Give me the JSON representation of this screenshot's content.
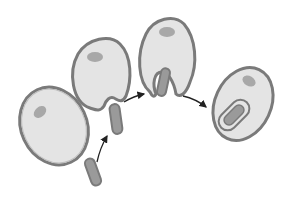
{
  "diagram": {
    "stages": [
      {
        "id": 1,
        "name": "cell-approaching-bacterium"
      },
      {
        "id": 2,
        "name": "membrane-invagination"
      },
      {
        "id": 3,
        "name": "pseudopod-engulfing"
      },
      {
        "id": 4,
        "name": "phagosome-formed"
      }
    ],
    "colors": {
      "background": "#ffffff",
      "cell_fill": "#e4e4e4",
      "membrane_outer": "#7a7a7a",
      "membrane_inner": "#b8b8b8",
      "nucleus": "#a8a8a8",
      "bacterium_fill": "#9a9a9a",
      "arrow": "#222222"
    }
  }
}
